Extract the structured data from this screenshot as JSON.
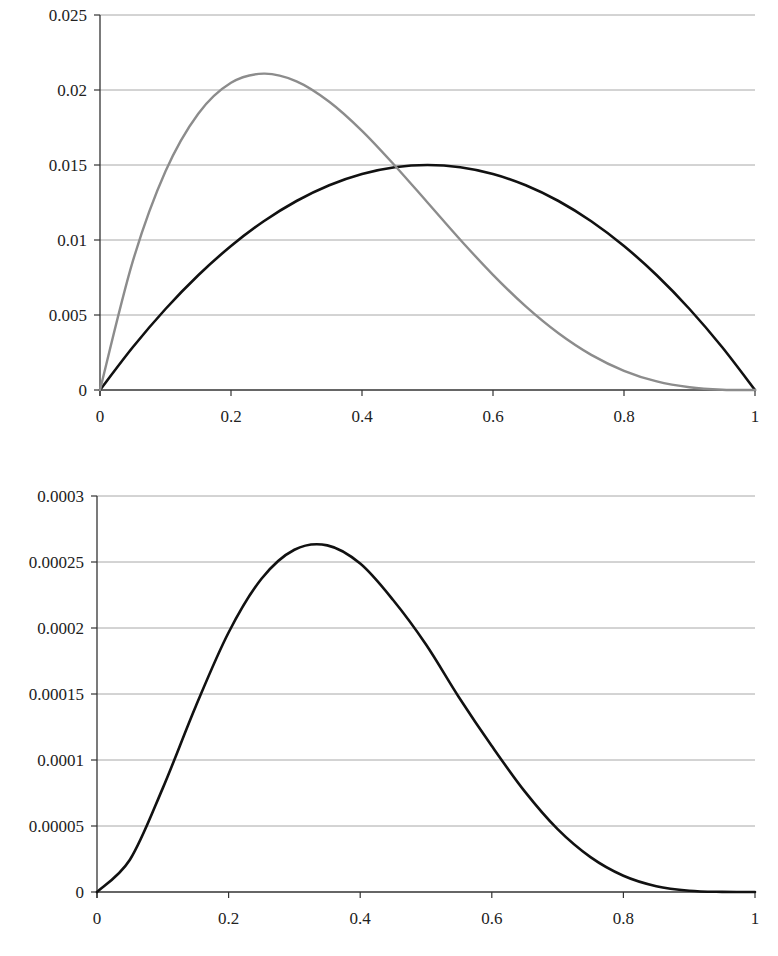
{
  "chart_data": [
    {
      "type": "line",
      "title": "",
      "xlabel": "",
      "ylabel": "",
      "xlim": [
        0,
        1
      ],
      "ylim": [
        0,
        0.025
      ],
      "grid": true,
      "legend": "none",
      "x_ticks": [
        "0",
        "0.2",
        "0.4",
        "0.6",
        "0.8",
        "1"
      ],
      "y_ticks": [
        "0",
        "0.005",
        "0.01",
        "0.015",
        "0.02",
        "0.025"
      ],
      "x": [
        0,
        0.05,
        0.1,
        0.15,
        0.2,
        0.25,
        0.3,
        0.35,
        0.4,
        0.45,
        0.5,
        0.55,
        0.6,
        0.65,
        0.7,
        0.75,
        0.8,
        0.85,
        0.9,
        0.95,
        1
      ],
      "series": [
        {
          "name": "black curve",
          "color": "#111111",
          "values": [
            0,
            0.00285,
            0.0054,
            0.00765,
            0.0096,
            0.01125,
            0.0126,
            0.01365,
            0.0144,
            0.01485,
            0.015,
            0.01485,
            0.0144,
            0.01365,
            0.0126,
            0.01125,
            0.0096,
            0.00765,
            0.0054,
            0.00285,
            0
          ]
        },
        {
          "name": "gray curve",
          "color": "#8c8c8c",
          "values": [
            0,
            0.00857,
            0.01458,
            0.01842,
            0.02048,
            0.02109,
            0.02058,
            0.01922,
            0.01728,
            0.01497,
            0.0125,
            0.01002,
            0.00768,
            0.00557,
            0.00378,
            0.00234,
            0.00128,
            0.00057,
            0.00018,
            2e-05,
            0
          ]
        }
      ]
    },
    {
      "type": "line",
      "title": "",
      "xlabel": "",
      "ylabel": "",
      "xlim": [
        0,
        1
      ],
      "ylim": [
        0,
        0.0003
      ],
      "grid": true,
      "legend": "none",
      "x_ticks": [
        "0",
        "0.2",
        "0.4",
        "0.6",
        "0.8",
        "1"
      ],
      "y_ticks": [
        "0",
        "0.00005",
        "0.0001",
        "0.00015",
        "0.0002",
        "0.00025",
        "0.0003"
      ],
      "x": [
        0,
        0.05,
        0.1,
        0.15,
        0.2,
        0.25,
        0.3,
        0.35,
        0.4,
        0.45,
        0.5,
        0.55,
        0.6,
        0.65,
        0.7,
        0.75,
        0.8,
        0.85,
        0.9,
        0.95,
        1
      ],
      "series": [
        {
          "name": "black curve",
          "color": "#111111",
          "values": [
            0,
            2.44e-05,
            7.87e-05,
            0.0001406,
            0.0001966,
            0.0002373,
            0.0002593,
            0.0002626,
            0.0002488,
            0.0002212,
            0.0001875,
            0.0001476,
            0.0001106,
            7.62e-05,
            4.76e-05,
            2.64e-05,
            1.23e-05,
            4.4e-06,
            1e-06,
            1e-07,
            0
          ]
        }
      ]
    }
  ]
}
